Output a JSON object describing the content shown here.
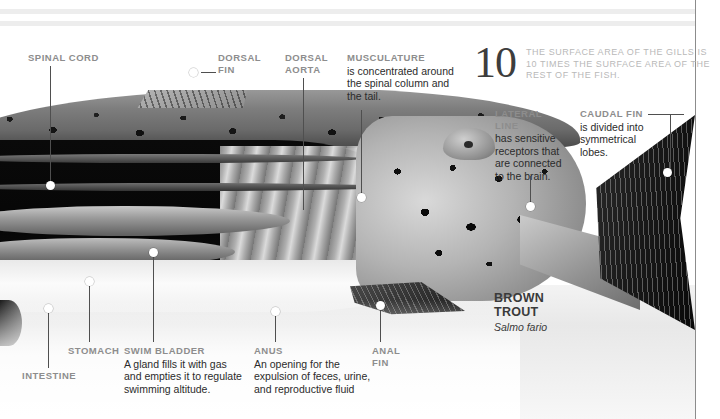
{
  "figure": {
    "species_common_name": "BROWN\nTROUT",
    "species_name_line1": "BROWN",
    "species_name_line2": "TROUT",
    "species_scientific_name": "Salmo fario"
  },
  "stat": {
    "number": "10",
    "text": "THE SURFACE AREA OF THE GILLS IS 10 TIMES THE SURFACE AREA OF THE REST OF THE FISH."
  },
  "callouts": {
    "spinal_cord": {
      "heading": "SPINAL CORD",
      "body": ""
    },
    "dorsal_fin": {
      "heading_line1": "DORSAL",
      "heading_line2": "FIN",
      "body": ""
    },
    "dorsal_aorta": {
      "heading_line1": "DORSAL",
      "heading_line2": "AORTA",
      "body": ""
    },
    "musculature": {
      "heading": "MUSCULATURE",
      "body": "is concentrated around the spinal column and the tail."
    },
    "lateral_line": {
      "heading": "LATERAL LINE",
      "body": "has sensitive receptors that are connected to the brain."
    },
    "caudal_fin": {
      "heading": "CAUDAL FIN",
      "body": "is divided into symmetrical lobes."
    },
    "intestine": {
      "heading": "INTESTINE",
      "body": ""
    },
    "stomach": {
      "heading": "STOMACH",
      "body": ""
    },
    "swim_bladder": {
      "heading": "SWIM BLADDER",
      "body": "A gland fills it with gas and empties it to regulate swimming altitude."
    },
    "anus": {
      "heading": "ANUS",
      "body": "An opening for the expulsion of feces, urine, and reproductive fluid"
    },
    "anal_fin": {
      "heading_line1": "ANAL",
      "heading_line2": "FIN",
      "body": ""
    }
  },
  "colors": {
    "label": "#8d8d8d",
    "body_text": "#2b2b2b",
    "stat_text": "#b9b9b9",
    "leader": "#4f4f4f",
    "rule": "#ededed"
  }
}
